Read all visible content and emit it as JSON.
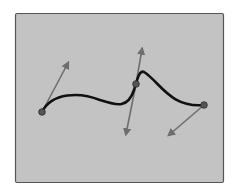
{
  "diagram": {
    "type": "spline-with-tangents",
    "panel": {
      "x": 15,
      "y": 13,
      "width": 208,
      "height": 169,
      "fill": "#c3c3c3",
      "border": "#555555"
    },
    "curve": {
      "color": "#111111",
      "width": 2.6,
      "path": "M42,112 C52,92 80,92 100,100 C118,106 128,108 134,90 C138,76 140,70 144,72 C160,82 170,108 204,105"
    },
    "control_points": [
      {
        "name": "point-1",
        "x": 42,
        "y": 112
      },
      {
        "name": "point-2",
        "x": 136,
        "y": 84
      },
      {
        "name": "point-3",
        "x": 204,
        "y": 105
      }
    ],
    "point_color": "#555555",
    "arrow_color": "#6e6e6e",
    "tangent_arrows": [
      {
        "name": "tangent-arrow-1",
        "x1": 42,
        "y1": 112,
        "x2": 68,
        "y2": 63
      },
      {
        "name": "tangent-arrow-2-up",
        "x1": 136,
        "y1": 84,
        "x2": 142,
        "y2": 49
      },
      {
        "name": "tangent-arrow-2-down",
        "x1": 136,
        "y1": 84,
        "x2": 126,
        "y2": 134
      },
      {
        "name": "tangent-arrow-3",
        "x1": 204,
        "y1": 105,
        "x2": 169,
        "y2": 135
      }
    ]
  }
}
